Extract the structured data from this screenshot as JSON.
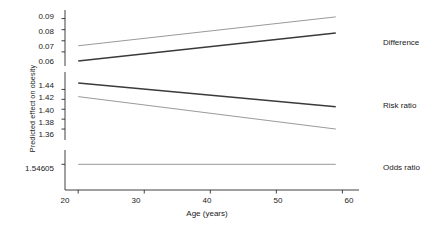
{
  "chart_data": {
    "type": "line",
    "title": "",
    "xlabel": "Age (years)",
    "ylabel": "Predicted effect on obesity",
    "xlim": [
      18,
      61
    ],
    "x_ticks": [
      "20",
      "30",
      "40",
      "50",
      "60"
    ],
    "x_tick_values": [
      20,
      30,
      40,
      50,
      60
    ],
    "x": [
      20,
      59
    ],
    "broken_axis": true,
    "grid": false,
    "legend_position": "right-inline",
    "panels": [
      {
        "name": "difference-panel",
        "y_ticks": [
          "0.09",
          "0.08",
          "0.07",
          "0.06"
        ],
        "y_tick_values": [
          0.09,
          0.08,
          0.07,
          0.06
        ],
        "ylim": [
          0.05,
          0.095
        ]
      },
      {
        "name": "risk-ratio-panel",
        "y_ticks": [
          "1.44",
          "1.42",
          "1.40",
          "1.38",
          "1.36"
        ],
        "y_tick_values": [
          1.44,
          1.42,
          1.4,
          1.38,
          1.36
        ],
        "ylim": [
          1.35,
          1.455
        ]
      },
      {
        "name": "odds-ratio-panel",
        "y_ticks": [
          "1.54605"
        ],
        "y_tick_values": [
          1.54605
        ],
        "ylim": [
          1.54,
          1.55
        ]
      }
    ],
    "series": [
      {
        "name": "Difference",
        "panel": "difference-panel",
        "lines": [
          {
            "style": "upper-light",
            "x": [
              20,
              59
            ],
            "values": [
              0.0655,
              0.0915
            ]
          },
          {
            "style": "lower-dark",
            "x": [
              20,
              59
            ],
            "values": [
              0.0518,
              0.077
            ]
          }
        ],
        "label": "Difference"
      },
      {
        "name": "Risk ratio",
        "panel": "risk-ratio-panel",
        "lines": [
          {
            "style": "upper-dark",
            "x": [
              20,
              59
            ],
            "values": [
              1.453,
              1.405
            ]
          },
          {
            "style": "lower-light",
            "x": [
              20,
              59
            ],
            "values": [
              1.4255,
              1.36
            ]
          }
        ],
        "label": "Risk ratio"
      },
      {
        "name": "Odds ratio",
        "panel": "odds-ratio-panel",
        "lines": [
          {
            "style": "flat-light",
            "x": [
              20,
              59
            ],
            "values": [
              1.54605,
              1.54605
            ]
          }
        ],
        "label": "Odds ratio"
      }
    ],
    "series_labels": [
      "Difference",
      "Risk ratio",
      "Odds ratio"
    ],
    "colors": {
      "dark_line": "#3a3a3a",
      "light_line": "#9a9a9a",
      "axis": "#2b2b2b",
      "text": "#1a1a1a",
      "background": "#ffffff"
    }
  },
  "axes": {
    "y_title": "Predicted effect on obesity",
    "x_title": "Age (years)",
    "y_ticks_top": [
      "0.09",
      "0.08",
      "0.07",
      "0.06"
    ],
    "y_ticks_mid": [
      "1.44",
      "1.42",
      "1.40",
      "1.38",
      "1.36"
    ],
    "y_ticks_bottom": [
      "1.54605"
    ],
    "x_ticks": [
      "20",
      "30",
      "40",
      "50",
      "60"
    ]
  },
  "labels": {
    "difference": "Difference",
    "risk_ratio": "Risk ratio",
    "odds_ratio": "Odds ratio"
  }
}
